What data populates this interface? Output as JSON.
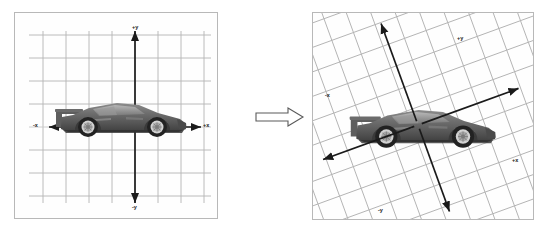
{
  "figure": {
    "background_color": "#ffffff",
    "panel_border_color": "#b8b8b8",
    "grid_color": "#b0b0b0",
    "axis_color": "#1a1a1a",
    "label_color": "#1a1a1a"
  },
  "panels": [
    {
      "id": "before",
      "name": "original-coordinate-system",
      "description": "Car aligned with an unrotated Cartesian grid",
      "grid": {
        "rotation_deg": 0,
        "spacing_px": 23,
        "columns": 8,
        "rows": 8,
        "visible": true
      },
      "axes": {
        "rotation_deg": 0,
        "origin": {
          "x": 120,
          "y": 114
        },
        "labels": {
          "x_positive": "+x",
          "x_negative": "-x",
          "y_positive": "+y",
          "y_negative": "-y"
        }
      },
      "object": {
        "name": "sports-car",
        "model": "Ferrari F40 side profile",
        "rotation_deg": 0,
        "color": "#5a5a5a"
      }
    },
    {
      "id": "after",
      "name": "rotated-coordinate-system",
      "description": "Same car with the Cartesian grid and axes rotated",
      "grid": {
        "rotation_deg": -20,
        "spacing_px": 23,
        "columns": 12,
        "rows": 12,
        "visible": true
      },
      "axes": {
        "rotation_deg": -20,
        "origin": {
          "x": 105,
          "y": 112
        },
        "labels": {
          "x_positive": "+x",
          "x_negative": "-x",
          "y_positive": "+y",
          "y_negative": "-y"
        }
      },
      "object": {
        "name": "sports-car",
        "model": "Ferrari F40 side profile",
        "rotation_deg": 0,
        "color": "#5a5a5a"
      }
    }
  ],
  "transition": {
    "name": "transformation-arrow",
    "direction": "right",
    "style": "hollow-outline",
    "label": ""
  }
}
